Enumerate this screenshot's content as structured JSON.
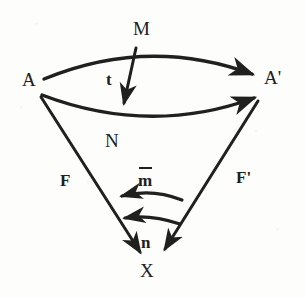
{
  "figure": {
    "kind": "commutative-diagram",
    "background_color": "#fdfdfc",
    "ink_color": "#20201e",
    "width": 305,
    "height": 298
  },
  "objects": [
    {
      "id": "A",
      "label": "A",
      "x": 30,
      "y": 80
    },
    {
      "id": "Ap",
      "label": "A'",
      "x": 268,
      "y": 78
    },
    {
      "id": "M",
      "label": "M",
      "x": 140,
      "y": 30
    },
    {
      "id": "N",
      "label": "N",
      "x": 107,
      "y": 142
    },
    {
      "id": "X",
      "label": "X",
      "x": 142,
      "y": 271
    }
  ],
  "morphisms": [
    {
      "id": "M",
      "label": "M",
      "from": "A",
      "to": "A'",
      "style": "arc-up",
      "overbar": false
    },
    {
      "id": "N",
      "label": "N",
      "from": "A",
      "to": "A'",
      "style": "arc-down",
      "overbar": false
    },
    {
      "id": "t",
      "label": "t",
      "from": "M",
      "to": "N",
      "style": "straight",
      "overbar": false
    },
    {
      "id": "F",
      "label": "F",
      "from": "A",
      "to": "X",
      "style": "straight",
      "overbar": false
    },
    {
      "id": "Fp",
      "label": "F'",
      "from": "A'",
      "to": "X",
      "style": "straight",
      "overbar": false
    },
    {
      "id": "mbar",
      "label": "m",
      "from": "F'",
      "to": "F",
      "style": "arc-left",
      "overbar": true
    },
    {
      "id": "n",
      "label": "n",
      "from": "F'",
      "to": "F",
      "style": "arc-left",
      "overbar": false
    }
  ],
  "labels": {
    "A": "A",
    "A_prime": "A'",
    "M": "M",
    "N": "N",
    "X": "X",
    "t": "t",
    "F": "F",
    "F_prime": "F'",
    "m": "m",
    "n": "n"
  },
  "label_positions": {
    "A": {
      "x": 22,
      "y": 70
    },
    "A_prime": {
      "x": 264,
      "y": 68
    },
    "M": {
      "x": 133,
      "y": 19
    },
    "N": {
      "x": 105,
      "y": 131
    },
    "X": {
      "x": 140,
      "y": 261
    },
    "t": {
      "x": 106,
      "y": 71
    },
    "F": {
      "x": 60,
      "y": 172
    },
    "F_prime": {
      "x": 236,
      "y": 169
    },
    "m": {
      "x": 138,
      "y": 172
    },
    "n": {
      "x": 141,
      "y": 234
    }
  }
}
